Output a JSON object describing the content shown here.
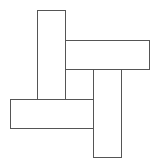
{
  "diagram": {
    "title": "",
    "canvas": {
      "width": 158,
      "height": 164,
      "background": "#ffffff"
    },
    "stroke_color": "#555555",
    "fill_color": "#ffffff",
    "shapes": [
      {
        "id": "vertical-top-left",
        "type": "rect",
        "x": 37.5,
        "y": 10.5,
        "width": 28,
        "height": 89
      },
      {
        "id": "horizontal-top-right",
        "type": "rect",
        "x": 65.5,
        "y": 40.5,
        "width": 84,
        "height": 29
      },
      {
        "id": "vertical-bottom-right",
        "type": "rect",
        "x": 93.5,
        "y": 69.5,
        "width": 28,
        "height": 88
      },
      {
        "id": "horizontal-bottom-left",
        "type": "rect",
        "x": 10.5,
        "y": 99.5,
        "width": 83,
        "height": 29
      }
    ]
  }
}
